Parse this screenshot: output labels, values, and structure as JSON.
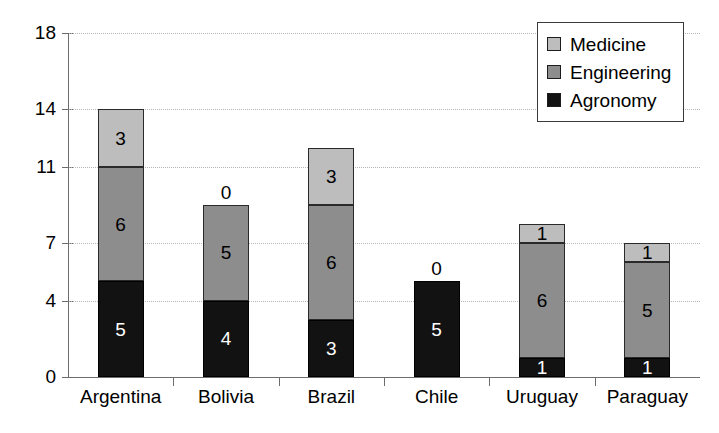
{
  "chart_data": {
    "type": "bar",
    "subtype": "stacked-vertical",
    "title": "",
    "xlabel": "",
    "ylabel": "",
    "categories": [
      "Argentina",
      "Bolivia",
      "Brazil",
      "Chile",
      "Uruguay",
      "Paraguay"
    ],
    "series": [
      {
        "name": "Agronomy",
        "color": "#121212",
        "values": [
          5,
          4,
          3,
          5,
          1,
          1
        ]
      },
      {
        "name": "Engineering",
        "color": "#8d8d8d",
        "values": [
          6,
          5,
          6,
          0,
          6,
          5
        ]
      },
      {
        "name": "Medicine",
        "color": "#bdbdbd",
        "values": [
          3,
          0,
          3,
          0,
          1,
          1
        ]
      }
    ],
    "totals": [
      14,
      9,
      12,
      5,
      8,
      7
    ],
    "ylim": [
      0,
      18
    ],
    "ytick_labels": [
      "0",
      "4",
      "7",
      "11",
      "14",
      "18"
    ],
    "ytick_values": [
      0,
      4,
      7,
      11,
      14,
      18
    ],
    "grid": "horizontal-dotted",
    "legend_position": "top-right",
    "legend_order": [
      "Medicine",
      "Engineering",
      "Agronomy"
    ],
    "data_labels": "inside-segments; zero-valued segments labelled above bar top"
  }
}
